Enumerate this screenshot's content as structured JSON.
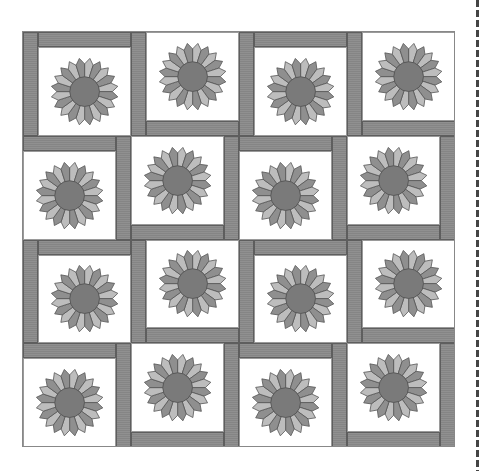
{
  "diagram": {
    "type": "quilt-layout",
    "grid": {
      "rows": 4,
      "cols": 4
    },
    "block": {
      "motif": "dresden-plate-flower",
      "petals": 20,
      "colors": {
        "petal_light": "#bdbdbd",
        "petal_medium": "#8f8f8f",
        "petal_stroke": "#555555",
        "center": "#7a7a7a",
        "background": "#ffffff",
        "sashing": "#8a8a8a"
      }
    },
    "cells": [
      [
        "left-top",
        "left-bottom",
        "left-top",
        "left-bottom"
      ],
      [
        "top-right",
        "bottom-right",
        "top-right",
        "bottom-right"
      ],
      [
        "left-top",
        "left-bottom",
        "left-top",
        "left-bottom"
      ],
      [
        "top-right",
        "bottom-right",
        "top-right",
        "bottom-right"
      ]
    ],
    "cut_line": {
      "style": "dashed",
      "position": "right"
    }
  }
}
